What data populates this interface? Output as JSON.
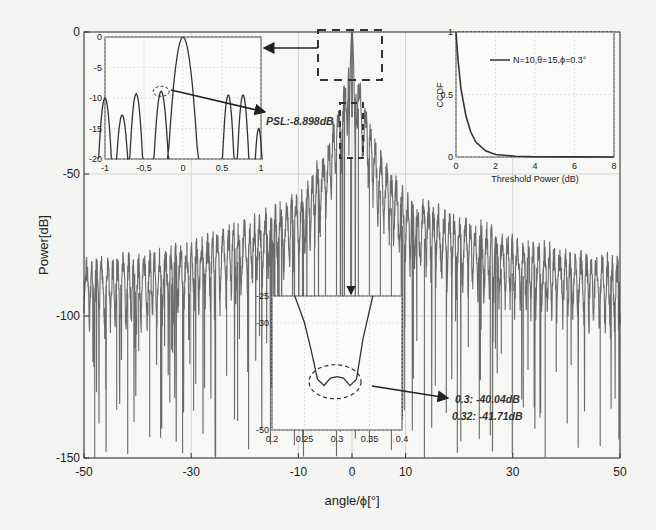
{
  "chart_data": {
    "type": "line",
    "title": "",
    "xlabel": "angle/ϕ[°]",
    "ylabel": "Power[dB]",
    "xlim": [
      -50,
      50
    ],
    "ylim": [
      -150,
      0
    ],
    "xticks": [
      -50,
      -30,
      -10,
      0,
      10,
      30,
      50
    ],
    "yticks": [
      0,
      -50,
      -100,
      -150
    ],
    "grid": true,
    "series": [
      {
        "name": "beam pattern",
        "description": "Dense oscillating power pattern; main lobe peak 0 dB at 0°, sidelobe envelope near -50 dB close to center decaying to about -75..-85 dB at ±50°, deep nulls reaching -100 to -150 dB",
        "envelope_x": [
          -50,
          -40,
          -30,
          -20,
          -10,
          -5,
          -2,
          0,
          2,
          5,
          10,
          20,
          30,
          40,
          50
        ],
        "envelope_y": [
          -78,
          -77,
          -72,
          -65,
          -55,
          -40,
          -20,
          0,
          -20,
          -40,
          -55,
          -63,
          -70,
          -75,
          -78
        ]
      }
    ],
    "insets": [
      {
        "name": "main-lobe zoom",
        "type": "line",
        "xlim": [
          -1,
          1
        ],
        "ylim": [
          -20,
          0
        ],
        "xticks": [
          "-1",
          "-0.5",
          "0",
          "0.5",
          "1"
        ],
        "yticks": [
          "0",
          "-5",
          "-10",
          "-15",
          "-20"
        ],
        "peaks_x": [
          -1.0,
          -0.78,
          -0.6,
          -0.28,
          0,
          0.58,
          0.77,
          0.97
        ],
        "peaks_y": [
          -10,
          -12.8,
          -9.3,
          -8.9,
          0,
          -9.5,
          -9.5,
          -15
        ],
        "annotation": "PSL:-8.898dB"
      },
      {
        "name": "CCDF",
        "type": "line",
        "xlabel": "Threshold Power (dB)",
        "ylabel": "CCDF",
        "xlim": [
          0,
          8
        ],
        "ylim": [
          0,
          1
        ],
        "xticks": [
          "0",
          "2",
          "4",
          "6",
          "8"
        ],
        "yticks": [
          "0",
          "0.5",
          "1"
        ],
        "legend": "N=10,θ=15,ϕ=0.3°",
        "x": [
          0,
          0.1,
          0.25,
          0.5,
          0.75,
          1.0,
          1.5,
          2.0,
          3.0,
          4.0,
          6.0,
          8.0
        ],
        "y": [
          1.0,
          0.78,
          0.55,
          0.33,
          0.2,
          0.12,
          0.05,
          0.02,
          0.006,
          0.002,
          0.0005,
          0.0
        ]
      },
      {
        "name": "null zoom",
        "type": "line",
        "xlim": [
          0.2,
          0.4
        ],
        "ylim": [
          -50,
          -25
        ],
        "xticks": [
          "0.2",
          "0.25",
          "0.3",
          "0.35",
          "0.4"
        ],
        "yticks": [
          "-25",
          "-30",
          "-50"
        ],
        "x": [
          0.235,
          0.25,
          0.26,
          0.27,
          0.28,
          0.29,
          0.3,
          0.31,
          0.32,
          0.33,
          0.34,
          0.355
        ],
        "y": [
          -25,
          -30,
          -35,
          -40.5,
          -41.7,
          -40.3,
          -40.04,
          -40.3,
          -41.71,
          -40.5,
          -33,
          -25
        ],
        "annotations": [
          "0.3: -40.04dB",
          "0.32: -41.71dB"
        ]
      }
    ]
  }
}
